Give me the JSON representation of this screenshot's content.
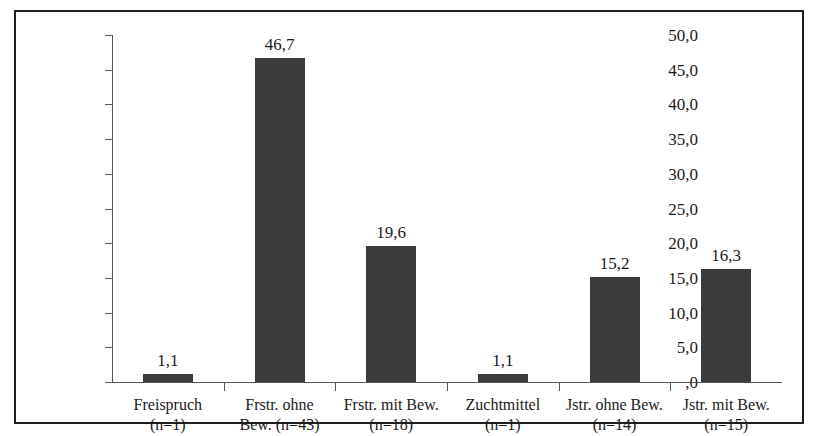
{
  "figure": {
    "title_fragment": "",
    "background": "#ffffff",
    "frame_color": "#1f1f1f",
    "bar_color": "#3b3b3b",
    "axis_color": "#55555a"
  },
  "chart_data": {
    "type": "bar",
    "title": "",
    "xlabel": "",
    "ylabel": "Angaben in Prozent",
    "ylim": [
      0,
      50
    ],
    "ytick_labels": [
      "50,0",
      "45,0",
      "40,0",
      "35,0",
      "30,0",
      "25,0",
      "20,0",
      "15,0",
      "10,0",
      "5,0",
      ",0"
    ],
    "ytick_values": [
      50,
      45,
      40,
      35,
      30,
      25,
      20,
      15,
      10,
      5,
      0
    ],
    "grid": false,
    "legend": null,
    "decimal_separator": ",",
    "categories": [
      "Freispruch\n(n=1)",
      "Frstr. ohne Bew. (n=43)",
      "Frstr. mit Bew. (n=18)",
      "Zuchtmittel\n(n=1)",
      "Jstr. ohne Bew. (n=14)",
      "Jstr. mit Bew. (n=15)"
    ],
    "values": [
      1.1,
      46.7,
      19.6,
      1.1,
      15.2,
      16.3
    ],
    "value_labels": [
      "1,1",
      "46,7",
      "19,6",
      "1,1",
      "15,2",
      "16,3"
    ],
    "bars": [
      {
        "line1": "Freispruch",
        "line2": "(n=1)",
        "value": 1.1,
        "value_label": "1,1",
        "n": 1
      },
      {
        "line1": "Frstr. ohne",
        "line2": "Bew. (n=43)",
        "value": 46.7,
        "value_label": "46,7",
        "n": 43
      },
      {
        "line1": "Frstr. mit Bew.",
        "line2": "(n=18)",
        "value": 19.6,
        "value_label": "19,6",
        "n": 18
      },
      {
        "line1": "Zuchtmittel",
        "line2": "(n=1)",
        "value": 1.1,
        "value_label": "1,1",
        "n": 1
      },
      {
        "line1": "Jstr. ohne Bew.",
        "line2": "(n=14)",
        "value": 15.2,
        "value_label": "15,2",
        "n": 14
      },
      {
        "line1": "Jstr. mit Bew.",
        "line2": "(n=15)",
        "value": 16.3,
        "value_label": "16,3",
        "n": 15
      }
    ]
  }
}
